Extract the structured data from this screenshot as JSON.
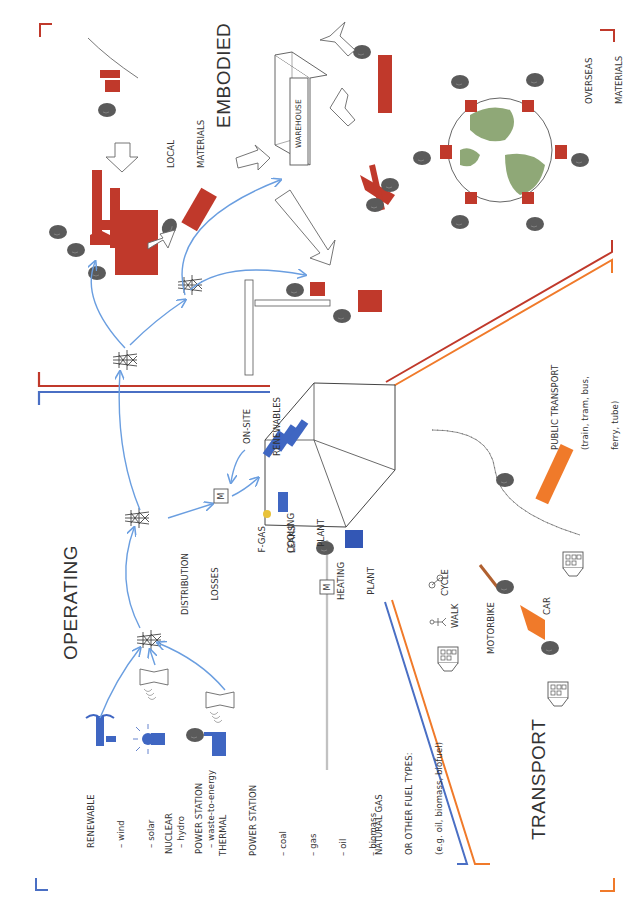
{
  "sections": {
    "operating": "OPERATING",
    "embodied": "EMBODIED",
    "transport": "TRANSPORT"
  },
  "colors": {
    "operating_blue": "#4a6fc4",
    "embodied_red": "#c0392b",
    "transport_orange": "#f07a2a",
    "arrow_blue": "#6a9ee0",
    "smoke_grey": "#555555",
    "globe_green": "#8fa877"
  },
  "energy_sources": {
    "renewable": {
      "title": "RENEWABLE",
      "items": [
        "– wind",
        "– solar",
        "– hydro",
        "– waste-to-energy"
      ]
    },
    "nuclear": {
      "line1": "NUCLEAR",
      "line2": "POWER STATION"
    },
    "thermal": {
      "line1": "THERMAL",
      "line2": "POWER STATION",
      "items": [
        "– coal",
        "– gas",
        "– oil",
        "– biomass"
      ]
    }
  },
  "operating_labels": {
    "distribution_losses": [
      "DISTRIBUTION",
      "LOSSES"
    ],
    "meter": "M",
    "on_site_renewables": [
      "ON-SITE",
      "RENEWABLES"
    ],
    "f_gas_leaks": [
      "F-GAS",
      "LEAKS"
    ],
    "cooling_plant": [
      "COOLING",
      "PLANT"
    ],
    "heating_plant": [
      "HEATING",
      "PLANT"
    ],
    "fuel_supply": [
      "NATURAL GAS",
      "OR OTHER FUEL TYPES:",
      "(e.g. oil, biomass, biofuel)"
    ]
  },
  "embodied_labels": {
    "local_materials": [
      "LOCAL",
      "MATERIALS"
    ],
    "warehouse": "WAREHOUSE",
    "overseas_materials": [
      "OVERSEAS",
      "MATERIALS"
    ]
  },
  "transport_labels": {
    "public_transport": [
      "PUBLIC TRANSPORT",
      "(train, tram, bus,",
      "ferry, tube)"
    ],
    "cycle": "CYCLE",
    "walk": "WALK",
    "motorbike": "MOTORBIKE",
    "car": "CAR"
  }
}
